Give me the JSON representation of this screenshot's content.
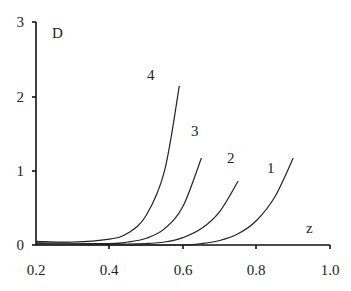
{
  "chart_data": {
    "type": "line",
    "title": "",
    "xlabel": "z",
    "ylabel": "D",
    "xlim": [
      0.2,
      1.0
    ],
    "ylim": [
      0,
      3
    ],
    "grid": false,
    "legend": "none (curves labelled inline)",
    "x_ticks": [
      "0.2",
      "0.4",
      "0.6",
      "0.8",
      "1.0"
    ],
    "y_ticks": [
      "0",
      "1",
      "2",
      "3"
    ],
    "series": [
      {
        "name": "1",
        "x": [
          0.2,
          0.4,
          0.6,
          0.65,
          0.7,
          0.75,
          0.8,
          0.85,
          0.9
        ],
        "y": [
          0.0,
          0.0,
          0.0,
          0.02,
          0.06,
          0.15,
          0.33,
          0.65,
          1.17
        ]
      },
      {
        "name": "2",
        "x": [
          0.2,
          0.4,
          0.5,
          0.55,
          0.6,
          0.65,
          0.7,
          0.75
        ],
        "y": [
          0.02,
          0.01,
          0.02,
          0.04,
          0.1,
          0.22,
          0.45,
          0.86
        ]
      },
      {
        "name": "3",
        "x": [
          0.2,
          0.4,
          0.45,
          0.5,
          0.55,
          0.6,
          0.65
        ],
        "y": [
          0.03,
          0.02,
          0.04,
          0.09,
          0.22,
          0.52,
          1.17
        ]
      },
      {
        "name": "4",
        "x": [
          0.2,
          0.3,
          0.4,
          0.45,
          0.5,
          0.55,
          0.59
        ],
        "y": [
          0.05,
          0.04,
          0.08,
          0.16,
          0.4,
          1.0,
          2.14
        ]
      }
    ],
    "annotations": [
      {
        "text": "4",
        "x": 0.52,
        "y": 2.3
      },
      {
        "text": "3",
        "x": 0.61,
        "y": 1.52
      },
      {
        "text": "2",
        "x": 0.71,
        "y": 1.17
      },
      {
        "text": "1",
        "x": 0.84,
        "y": 0.95
      }
    ]
  },
  "labels": {
    "y_axis": "D",
    "x_axis": "z",
    "x_ticks": [
      "0.2",
      "0.4",
      "0.6",
      "0.8",
      "1.0"
    ],
    "y_ticks": [
      "0",
      "1",
      "2",
      "3"
    ],
    "curves": [
      "1",
      "2",
      "3",
      "4"
    ]
  },
  "colors": {
    "axis": "#111111",
    "line": "#222222"
  }
}
